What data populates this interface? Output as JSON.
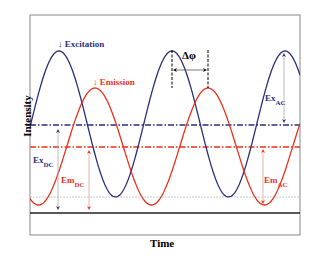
{
  "diagram": {
    "xlabel": "Time",
    "ylabel": "Intensity",
    "colors": {
      "excitation": "#2b2f7a",
      "emission": "#e8321e",
      "frame": "#888888",
      "baseline": "#222222",
      "gridline": "#bbbbbb"
    },
    "labels": {
      "excitation": "↓ Excitation",
      "emission": "↓ Emission",
      "phase": "Δφ",
      "ex_ac": "Ex",
      "ex_ac_sub": "AC",
      "ex_dc": "Ex",
      "ex_dc_sub": "DC",
      "em_dc": "Em",
      "em_dc_sub": "DC",
      "em_ac": "Em",
      "em_ac_sub": "AC"
    },
    "series": [
      {
        "name": "Excitation",
        "dc_level_y": 125,
        "amplitude_px": 73,
        "period_px": 113,
        "peak_x": 59
      },
      {
        "name": "Emission",
        "dc_level_y": 147,
        "amplitude_px": 58,
        "period_px": 113,
        "peak_x": 95
      }
    ]
  }
}
